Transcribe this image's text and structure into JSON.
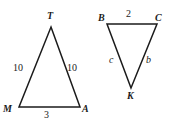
{
  "figure": {
    "background_color": "#ffffff",
    "stroke_color": "#1b1b1b",
    "text_color": "#1b1b1b"
  },
  "triangles": [
    {
      "id": "MTA",
      "name": "triangle-mta",
      "vertices": [
        {
          "label": "T",
          "x": 51,
          "y": 27
        },
        {
          "label": "A",
          "x": 80,
          "y": 107
        },
        {
          "label": "M",
          "x": 19,
          "y": 107
        }
      ],
      "vertex_labels": [
        {
          "text": "T",
          "x": 47,
          "y": 11
        },
        {
          "text": "M",
          "x": 3,
          "y": 104
        },
        {
          "text": "A",
          "x": 82,
          "y": 104
        }
      ],
      "side_labels": [
        {
          "text": "10",
          "x": 13,
          "y": 63
        },
        {
          "text": "10",
          "x": 67,
          "y": 63
        },
        {
          "text": "3",
          "x": 44,
          "y": 110
        }
      ]
    },
    {
      "id": "BCK",
      "name": "triangle-bck",
      "vertices": [
        {
          "label": "B",
          "x": 107,
          "y": 24
        },
        {
          "label": "C",
          "x": 157,
          "y": 24
        },
        {
          "label": "K",
          "x": 131,
          "y": 88
        }
      ],
      "vertex_labels": [
        {
          "text": "B",
          "x": 98,
          "y": 13
        },
        {
          "text": "C",
          "x": 155,
          "y": 13
        },
        {
          "text": "K",
          "x": 127,
          "y": 91
        }
      ],
      "side_labels": [
        {
          "text": "2",
          "x": 126,
          "y": 9
        },
        {
          "text": "c",
          "x": 109,
          "y": 55
        },
        {
          "text": "b",
          "x": 146,
          "y": 55
        }
      ]
    }
  ]
}
